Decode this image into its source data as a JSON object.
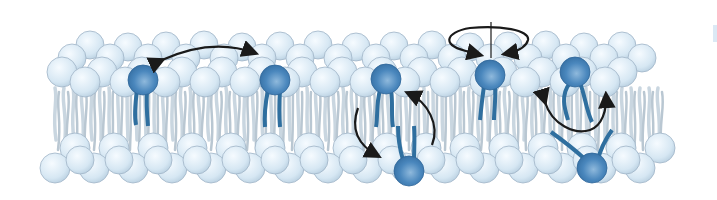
{
  "diagram": {
    "movements": [
      {
        "name": "lateral-diffusion",
        "marker": "double-headed arc arrow between two upper-leaflet lipids"
      },
      {
        "name": "transverse-diffusion-flip-flop",
        "marker": "curved arrows between upper and lower leaflet"
      },
      {
        "name": "rotation",
        "marker": "circular arrow around vertical axis"
      },
      {
        "name": "flexion",
        "marker": "curved double-headed arrow across tails"
      }
    ],
    "highlighted_lipids": [
      {
        "x": 143,
        "y": 80,
        "leaflet": "upper"
      },
      {
        "x": 275,
        "y": 80,
        "leaflet": "upper"
      },
      {
        "x": 386,
        "y": 79,
        "leaflet": "upper"
      },
      {
        "x": 490,
        "y": 75,
        "leaflet": "upper"
      },
      {
        "x": 575,
        "y": 72,
        "leaflet": "upper"
      },
      {
        "x": 409,
        "y": 171,
        "leaflet": "lower"
      },
      {
        "x": 592,
        "y": 168,
        "leaflet": "lower"
      }
    ],
    "colors": {
      "head_pale": "#dcebf6",
      "head_edge": "#9fb4c6",
      "head_highlight": "#3f7fb5",
      "tail_pale": "#c9d6e0",
      "tail_highlight": "#2f6f9f",
      "arrow": "#1a1a1a"
    }
  }
}
